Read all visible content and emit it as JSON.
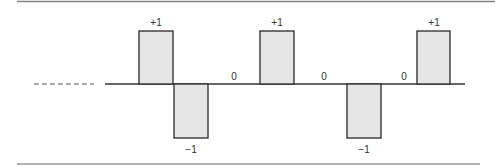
{
  "diagram": {
    "type": "bipolar-pulse-sequence",
    "colors": {
      "rule": "#888888",
      "line": "#333333",
      "pulse_fill": "#e6e6e6",
      "pulse_stroke": "#2a2a2a",
      "dash": "#555555"
    },
    "sequence": [
      "+1",
      "-1",
      "0",
      "+1",
      "0",
      "-1",
      "0",
      "+1"
    ],
    "labels": {
      "p1": "+1",
      "n1": "−1",
      "z1": "0",
      "p2": "+1",
      "z2": "0",
      "n2": "−1",
      "z3": "0",
      "p3": "+1"
    }
  }
}
